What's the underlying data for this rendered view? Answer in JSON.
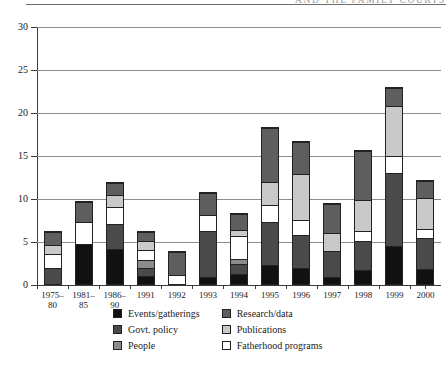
{
  "page": {
    "running_head": "AND THE FAMILY COURTS"
  },
  "chart_data": {
    "type": "bar",
    "stacked": true,
    "title": "",
    "xlabel": "",
    "ylabel": "",
    "ylim": [
      0,
      30
    ],
    "yticks": [
      0,
      5,
      10,
      15,
      20,
      25,
      30
    ],
    "grid": true,
    "legend_position": "bottom",
    "categories": [
      "1975–\n80",
      "1981–\n85",
      "1986–\n90",
      "1991",
      "1992",
      "1993",
      "1994",
      "1995",
      "1996",
      "1997",
      "1998",
      "1999",
      "2000"
    ],
    "series": [
      {
        "name": "Events/gatherings",
        "color": "#111111",
        "values": [
          0,
          4.8,
          4.2,
          0.9,
          0,
          0.8,
          1.2,
          2.2,
          1.8,
          0.7,
          1.6,
          4.5,
          1.8
        ]
      },
      {
        "name": "Govt. policy",
        "color": "#4a4a4a",
        "values": [
          1.9,
          0,
          3.0,
          1.0,
          0,
          5.6,
          1.2,
          5.1,
          4.0,
          3.2,
          3.4,
          8.6,
          3.7
        ]
      },
      {
        "name": "People",
        "color": "#8c8c8c",
        "values": [
          0,
          0,
          0,
          1.0,
          0,
          0,
          0.5,
          0,
          0,
          0,
          0,
          0,
          0
        ]
      },
      {
        "name": "Fatherhood programs",
        "color": "#ffffff",
        "values": [
          1.7,
          2.6,
          2.0,
          1.2,
          1.0,
          1.8,
          2.9,
          2.0,
          1.6,
          0,
          1.1,
          2.0,
          1.0
        ]
      },
      {
        "name": "Publications",
        "color": "#c9c9c9",
        "values": [
          1.1,
          0,
          1.4,
          1.1,
          0,
          0,
          0.6,
          2.6,
          5.6,
          2.1,
          3.7,
          5.9,
          3.7
        ]
      },
      {
        "name": "Research/data",
        "color": "#5e5e5e",
        "values": [
          1.6,
          2.4,
          1.4,
          1.1,
          3.0,
          2.6,
          2.0,
          6.5,
          3.8,
          3.5,
          5.9,
          2.0,
          2.0
        ]
      }
    ],
    "totals": [
      6.3,
      9.8,
      12.0,
      6.3,
      4.0,
      10.8,
      8.4,
      18.4,
      16.8,
      9.5,
      15.7,
      23.0,
      12.2
    ],
    "legend": [
      {
        "label": "Events/gatherings",
        "color": "#111111"
      },
      {
        "label": "Govt. policy",
        "color": "#4a4a4a"
      },
      {
        "label": "People",
        "color": "#8c8c8c"
      },
      {
        "label": "Research/data",
        "color": "#5e5e5e"
      },
      {
        "label": "Publications",
        "color": "#c9c9c9"
      },
      {
        "label": "Fatherhood programs",
        "color": "#ffffff"
      }
    ],
    "legend_columns": [
      [
        "Events/gatherings",
        "Govt. policy",
        "People"
      ],
      [
        "Research/data",
        "Publications",
        "Fatherhood programs"
      ]
    ]
  }
}
